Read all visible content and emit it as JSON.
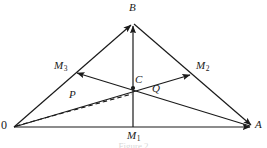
{
  "figure": {
    "type": "geometry-diagram",
    "background_color": "#ffffff",
    "line_color": "#1a1a1a",
    "caption": "Figure 2",
    "points": {
      "O": {
        "label": "0",
        "x": 14,
        "y": 127
      },
      "A": {
        "label": "A",
        "x": 253,
        "y": 127
      },
      "B": {
        "label": "B",
        "x": 133,
        "y": 22
      },
      "C": {
        "label": "C",
        "x": 133,
        "y": 88
      },
      "M1": {
        "label": "M",
        "sub": "1",
        "x": 133,
        "y": 127
      },
      "M2": {
        "label": "M",
        "sub": "2",
        "x": 193,
        "y": 74
      },
      "M3": {
        "label": "M",
        "sub": "3",
        "x": 74,
        "y": 74
      }
    },
    "vectors": {
      "P": {
        "label": "P",
        "from": "O",
        "to": "M2",
        "style": "solid"
      },
      "Q": {
        "label": "Q",
        "from": "A",
        "to": "M3",
        "style": "solid"
      }
    },
    "dashed_segment": {
      "from": "O",
      "to": "C"
    },
    "edges": [
      {
        "name": "side-OA",
        "from": "O",
        "to": "A",
        "arrow": "end"
      },
      {
        "name": "side-OB",
        "from": "O",
        "to": "B",
        "arrow": "end"
      },
      {
        "name": "side-BA",
        "from": "B",
        "to": "A",
        "arrow": "end"
      },
      {
        "name": "median-M1B",
        "from": "M1",
        "to": "B",
        "arrow": "end"
      },
      {
        "name": "median-O-M2",
        "from": "O",
        "to": "M2",
        "arrow": "end"
      },
      {
        "name": "median-A-M3",
        "from": "A",
        "to": "M3",
        "arrow": "end"
      }
    ],
    "arrow_markers": [
      {
        "name": "arrow-at-A",
        "at": "A"
      },
      {
        "name": "arrow-at-B-side",
        "at": "B"
      },
      {
        "name": "arrow-at-B-median",
        "at": "B"
      },
      {
        "name": "arrow-toward-M3",
        "at": "M3"
      },
      {
        "name": "arrow-toward-M2",
        "at": "M2"
      },
      {
        "name": "arrow-vector-P",
        "at": "P-midpoint"
      },
      {
        "name": "arrow-vector-Q",
        "at": "Q-midpoint"
      }
    ]
  }
}
